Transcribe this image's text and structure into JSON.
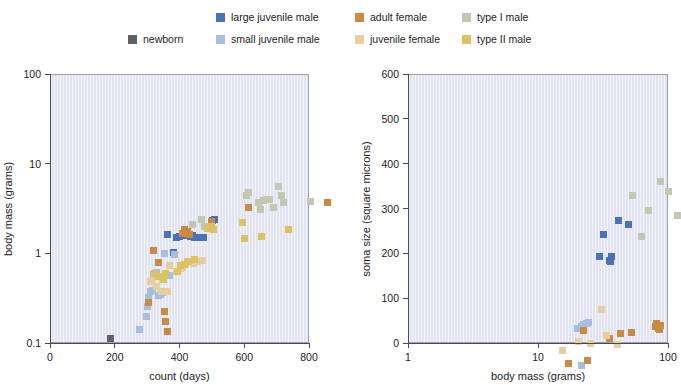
{
  "legend": {
    "entries": [
      {
        "label": "newborn",
        "color": "#5e6166",
        "col": 0,
        "row": 1
      },
      {
        "label": "large juvenile male",
        "color": "#4a72b8",
        "col": 1,
        "row": 0
      },
      {
        "label": "small juvenile male",
        "color": "#a8bee0",
        "col": 1,
        "row": 1
      },
      {
        "label": "adult female",
        "color": "#c98b43",
        "col": 2,
        "row": 0
      },
      {
        "label": "juvenile female",
        "color": "#e8cd9e",
        "col": 2,
        "row": 1
      },
      {
        "label": "type I male",
        "color": "#c3c7b4",
        "col": 3,
        "row": 0
      },
      {
        "label": "type II male",
        "color": "#dbc262",
        "col": 3,
        "row": 1
      }
    ]
  },
  "colors": {
    "newborn": "#5e6166",
    "large_juvenile_male": "#4a72b8",
    "small_juvenile_male": "#a8bee0",
    "adult_female": "#c98b43",
    "juvenile_female": "#e8cd9e",
    "type_I_male": "#c3c7b4",
    "type_II_male": "#dbc262",
    "plot_background": "#e2e5f1",
    "axis": "#4a4a4a",
    "plot_border": "#9aa0b4"
  },
  "chart_data": [
    {
      "type": "scatter",
      "title": "",
      "xlabel": "count (days)",
      "ylabel": "body mass (grams)",
      "xscale": "linear",
      "yscale": "log",
      "xlim": [
        0,
        800
      ],
      "ylim": [
        0.1,
        100
      ],
      "xticks": [
        0,
        200,
        400,
        600,
        800
      ],
      "xtick_labels": [
        "0",
        "200",
        "400",
        "600",
        "800"
      ],
      "yticks": [
        0.1,
        1,
        10,
        100
      ],
      "ytick_labels": [
        "0.1",
        "1",
        "10",
        "100"
      ],
      "grid": false,
      "legend_position": "top",
      "series": [
        {
          "name": "newborn",
          "color": "#5e6166",
          "points": [
            [
              30,
              0.78
            ]
          ]
        },
        {
          "name": "large juvenile male",
          "color": "#4a72b8",
          "points": [
            [
              205,
              11.0
            ],
            [
              225,
              7.1
            ],
            [
              232,
              10.3
            ],
            [
              243,
              10.6
            ],
            [
              262,
              10.8
            ],
            [
              268,
              11.2
            ],
            [
              276,
              10.5
            ],
            [
              282,
              10.9
            ],
            [
              288,
              10.2
            ],
            [
              296,
              10.3
            ],
            [
              305,
              10.4
            ],
            [
              318,
              10.2
            ],
            [
              345,
              16.0
            ],
            [
              352,
              16.5
            ]
          ]
        },
        {
          "name": "small juvenile male",
          "color": "#a8bee0",
          "points": [
            [
              118,
              0.97
            ],
            [
              140,
              1.35
            ],
            [
              143,
              1.75
            ],
            [
              147,
              2.2
            ],
            [
              152,
              2.6
            ],
            [
              158,
              2.65
            ],
            [
              163,
              4.0
            ],
            [
              172,
              4.2
            ],
            [
              178,
              2.35
            ],
            [
              185,
              2.4
            ],
            [
              190,
              2.5
            ],
            [
              196,
              6.9
            ],
            [
              212,
              3.9
            ],
            [
              228,
              6.6
            ]
          ]
        },
        {
          "name": "adult female",
          "color": "#c98b43",
          "points": [
            [
              163,
              7.4
            ],
            [
              178,
              5.4
            ],
            [
              196,
              1.55
            ],
            [
              200,
              1.2
            ],
            [
              206,
              0.93
            ],
            [
              148,
              1.95
            ],
            [
              252,
              11.5
            ],
            [
              258,
              12.5
            ],
            [
              266,
              12.0
            ],
            [
              272,
              11.0
            ],
            [
              340,
              15.5
            ],
            [
              455,
              22.0
            ],
            [
              700,
              25.5
            ]
          ]
        },
        {
          "name": "juvenile female",
          "color": "#e8cd9e",
          "points": [
            [
              152,
              3.3
            ],
            [
              158,
              3.4
            ],
            [
              170,
              2.9
            ],
            [
              186,
              2.6
            ],
            [
              190,
              3.5
            ],
            [
              206,
              2.6
            ],
            [
              212,
              5.0
            ],
            [
              232,
              4.3
            ],
            [
              245,
              4.6
            ],
            [
              252,
              4.8
            ],
            [
              262,
              5.2
            ],
            [
              272,
              5.5
            ],
            [
              286,
              5.3
            ],
            [
              298,
              5.6
            ],
            [
              312,
              5.7
            ]
          ]
        },
        {
          "name": "type I male",
          "color": "#c3c7b4",
          "points": [
            [
              282,
              14.5
            ],
            [
              310,
              16.5
            ],
            [
              320,
              13.5
            ],
            [
              330,
              13.0
            ],
            [
              448,
              30.0
            ],
            [
              455,
              33.0
            ],
            [
              485,
              25.0
            ],
            [
              492,
              21.0
            ],
            [
              502,
              26.5
            ],
            [
              512,
              27.5
            ],
            [
              522,
              27.0
            ],
            [
              532,
              22.0
            ],
            [
              548,
              38.0
            ],
            [
              556,
              30.0
            ],
            [
              565,
              25.0
            ],
            [
              580,
              12.5
            ],
            [
              648,
              26.0
            ]
          ]
        },
        {
          "name": "type II male",
          "color": "#dbc262",
          "points": [
            [
              165,
              4.1
            ],
            [
              178,
              3.8
            ],
            [
              192,
              3.5
            ],
            [
              200,
              4.1
            ],
            [
              236,
              4.3
            ],
            [
              246,
              5.0
            ],
            [
              258,
              5.2
            ],
            [
              268,
              5.5
            ],
            [
              288,
              5.8
            ],
            [
              330,
              13.0
            ],
            [
              340,
              13.5
            ],
            [
              348,
              12.8
            ],
            [
              438,
              15.0
            ],
            [
              443,
              10.0
            ],
            [
              495,
              10.5
            ],
            [
              578,
              12.5
            ]
          ]
        }
      ]
    },
    {
      "type": "scatter",
      "title": "",
      "xlabel": "body mass (grams)",
      "ylabel": "soma size (square microns)",
      "xscale": "log",
      "yscale": "linear",
      "xlim": [
        1,
        100
      ],
      "ylim": [
        0,
        600
      ],
      "xticks": [
        1,
        10,
        100
      ],
      "xtick_labels": [
        "1",
        "10",
        "100"
      ],
      "yticks": [
        0,
        100,
        200,
        300,
        400,
        500,
        600
      ],
      "ytick_labels": [
        "0",
        "100",
        "200",
        "300",
        "400",
        "500",
        "600"
      ],
      "grid": false,
      "legend_position": "top",
      "series": [
        {
          "name": "large juvenile male",
          "color": "#4a72b8",
          "points": [
            [
              8.6,
              360
            ],
            [
              9.2,
              410
            ],
            [
              10.3,
              352
            ],
            [
              10.5,
              348
            ],
            [
              10.6,
              360
            ],
            [
              12.0,
              441
            ],
            [
              14.5,
              432
            ]
          ]
        },
        {
          "name": "small juvenile male",
          "color": "#a8bee0",
          "points": [
            [
              5.8,
              199
            ],
            [
              6.2,
              205
            ],
            [
              6.5,
              208
            ],
            [
              6.8,
              210
            ],
            [
              7.1,
              213
            ],
            [
              6.2,
              118
            ]
          ]
        },
        {
          "name": "adult female",
          "color": "#c98b43",
          "points": [
            [
              12.5,
              189
            ],
            [
              15.2,
              190
            ],
            [
              23.0,
              205
            ],
            [
              23.8,
              210
            ],
            [
              24.5,
              200
            ],
            [
              25.0,
              198
            ],
            [
              25.5,
              207
            ],
            [
              10.2,
              178
            ],
            [
              6.5,
              195
            ],
            [
              5.0,
              122
            ],
            [
              6.9,
              129
            ]
          ]
        },
        {
          "name": "juvenile female",
          "color": "#e8cd9e",
          "points": [
            [
              4.5,
              150
            ],
            [
              5.9,
              170
            ],
            [
              7.3,
              167
            ],
            [
              8.9,
              242
            ],
            [
              9.8,
              183
            ],
            [
              11.8,
              163
            ]
          ]
        },
        {
          "name": "type I male",
          "color": "#c3c7b4",
          "points": [
            [
              15.5,
              497
            ],
            [
              18.0,
              405
            ],
            [
              20.5,
              463
            ],
            [
              25.5,
              528
            ],
            [
              29.0,
              505
            ],
            [
              34.0,
              451
            ]
          ]
        },
        {
          "name": "type II male",
          "color": "#dbc262",
          "points": []
        }
      ]
    }
  ]
}
